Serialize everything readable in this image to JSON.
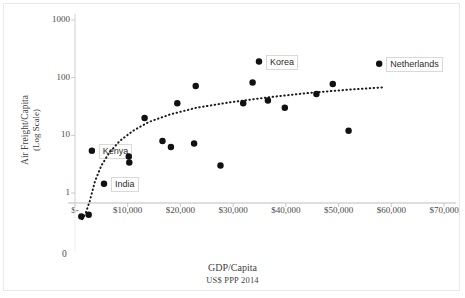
{
  "chart_data": {
    "type": "scatter",
    "title": "",
    "xlabel": "GDP/Capita",
    "xlabel_sub": "US$ PPP 2014",
    "ylabel": "Air Freight/Capita",
    "ylabel_sub": "(Log Scale)",
    "yscale": "log",
    "ylim": [
      1,
      1000
    ],
    "xlim": [
      0,
      70000
    ],
    "grid": false,
    "legend": null,
    "yticks": [
      {
        "value": 1000,
        "label": "1000"
      },
      {
        "value": 100,
        "label": "100"
      },
      {
        "value": 10,
        "label": "10"
      },
      {
        "value": 1,
        "label": "1"
      }
    ],
    "yticks_extra": [
      {
        "value": 0,
        "label": "0"
      }
    ],
    "xticks": [
      {
        "value": 0,
        "label": "$-"
      },
      {
        "value": 10000,
        "label": "$10,000"
      },
      {
        "value": 20000,
        "label": "$20,000"
      },
      {
        "value": 30000,
        "label": "$30,000"
      },
      {
        "value": 40000,
        "label": "$40,000"
      },
      {
        "value": 50000,
        "label": "$50,000"
      },
      {
        "value": 60000,
        "label": "$60,000"
      },
      {
        "value": 70000,
        "label": "$70,000"
      }
    ],
    "marker": {
      "shape": "circle",
      "color": "#111111",
      "size": 5
    },
    "points": [
      {
        "x": 1200,
        "y": 0.2,
        "label": null,
        "below_axis": true
      },
      {
        "x": 2600,
        "y": 0.26,
        "label": null,
        "below_axis": true
      },
      {
        "x": 5500,
        "y": 1.45,
        "label": "India",
        "label_pos": "right"
      },
      {
        "x": 3200,
        "y": 5.4,
        "label": "Kenya",
        "label_pos": "right"
      },
      {
        "x": 10200,
        "y": 4.3,
        "label": null
      },
      {
        "x": 10300,
        "y": 3.4,
        "label": null
      },
      {
        "x": 13200,
        "y": 20,
        "label": null
      },
      {
        "x": 16600,
        "y": 8.0,
        "label": null
      },
      {
        "x": 18200,
        "y": 6.3,
        "label": null
      },
      {
        "x": 19400,
        "y": 36,
        "label": null
      },
      {
        "x": 22600,
        "y": 7.2,
        "label": null
      },
      {
        "x": 22900,
        "y": 72,
        "label": null
      },
      {
        "x": 27600,
        "y": 3.0,
        "label": null
      },
      {
        "x": 31900,
        "y": 36,
        "label": null
      },
      {
        "x": 33700,
        "y": 82,
        "label": null
      },
      {
        "x": 34900,
        "y": 190,
        "label": "Korea",
        "label_pos": "right"
      },
      {
        "x": 36600,
        "y": 40,
        "label": null
      },
      {
        "x": 39800,
        "y": 30,
        "label": null
      },
      {
        "x": 45800,
        "y": 52,
        "label": null
      },
      {
        "x": 48900,
        "y": 78,
        "label": null
      },
      {
        "x": 51900,
        "y": 12,
        "label": null
      },
      {
        "x": 57700,
        "y": 175,
        "label": "Netherlands",
        "label_pos": "right"
      }
    ],
    "trendline": {
      "style": "dotted",
      "color": "#1a1a1a",
      "description": "logarithmic fit",
      "points": [
        {
          "x": 1350,
          "y": 0.1
        },
        {
          "x": 2000,
          "y": 0.3
        },
        {
          "x": 2800,
          "y": 0.75
        },
        {
          "x": 3800,
          "y": 1.6
        },
        {
          "x": 5000,
          "y": 3.0
        },
        {
          "x": 6500,
          "y": 5.0
        },
        {
          "x": 8500,
          "y": 8.0
        },
        {
          "x": 11000,
          "y": 12
        },
        {
          "x": 14000,
          "y": 17
        },
        {
          "x": 18000,
          "y": 23
        },
        {
          "x": 23000,
          "y": 30
        },
        {
          "x": 29000,
          "y": 37
        },
        {
          "x": 36000,
          "y": 45
        },
        {
          "x": 44000,
          "y": 54
        },
        {
          "x": 52000,
          "y": 62
        },
        {
          "x": 58500,
          "y": 68
        }
      ]
    }
  }
}
